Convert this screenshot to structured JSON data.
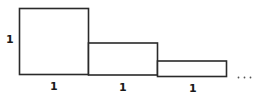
{
  "diagram": {
    "height_label": "1",
    "rectangles": [
      {
        "width_label": "1",
        "relative_height": 1
      },
      {
        "width_label": "1",
        "relative_height": 0.5
      },
      {
        "width_label": "1",
        "relative_height": 0.25
      }
    ],
    "continuation": "..."
  }
}
